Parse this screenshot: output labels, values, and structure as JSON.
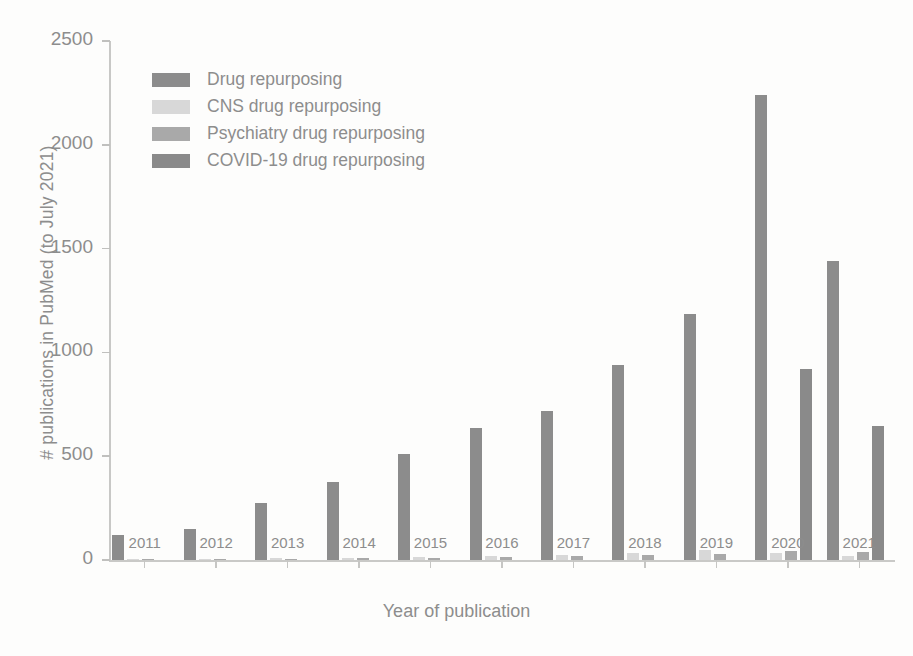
{
  "chart_data": {
    "type": "bar",
    "title": "",
    "xlabel": "Year of publication",
    "ylabel": "# publications in PubMed (to July 2021)",
    "categories": [
      "2011",
      "2012",
      "2013",
      "2014",
      "2015",
      "2016",
      "2017",
      "2018",
      "2019",
      "2020",
      "2021"
    ],
    "ylim": [
      0,
      2500
    ],
    "yticks": [
      0,
      500,
      1000,
      1500,
      2000,
      2500
    ],
    "ytick_labels": [
      "0",
      "500",
      "1000",
      "1500",
      "2000",
      "2500"
    ],
    "grid": false,
    "legend_position": "upper left",
    "series": [
      {
        "name": "Drug repurposing",
        "color": "#8c8c8c",
        "values": [
          120,
          150,
          275,
          378,
          510,
          635,
          718,
          940,
          1185,
          2240,
          1440
        ]
      },
      {
        "name": "CNS drug repurposing",
        "color": "#d8d8d8",
        "values": [
          4,
          5,
          8,
          12,
          14,
          18,
          26,
          36,
          48,
          34,
          20
        ]
      },
      {
        "name": "Psychiatry drug repurposing",
        "color": "#a9a9a9",
        "values": [
          2,
          3,
          5,
          8,
          10,
          16,
          20,
          26,
          30,
          44,
          38
        ]
      },
      {
        "name": "COVID-19 drug repurposing",
        "color": "#8a8a8a",
        "values": [
          0,
          0,
          0,
          0,
          0,
          0,
          0,
          0,
          0,
          920,
          645
        ]
      }
    ]
  },
  "legend": {
    "items": [
      {
        "label": "Drug repurposing",
        "color": "#8c8c8c"
      },
      {
        "label": "CNS drug repurposing",
        "color": "#d8d8d8"
      },
      {
        "label": "Psychiatry drug repurposing",
        "color": "#a9a9a9"
      },
      {
        "label": "COVID-19 drug repurposing",
        "color": "#8a8a8a"
      }
    ]
  },
  "axes": {
    "x_title": "Year of publication",
    "y_title": "# publications in PubMed (to July 2021)"
  }
}
